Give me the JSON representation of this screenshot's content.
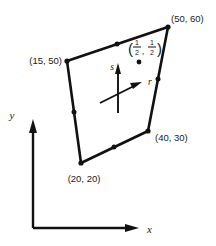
{
  "figure": {
    "background_color": "#ffffff",
    "line_color": "#111111"
  },
  "element": {
    "name": "quadrilateral-element",
    "corner_labels": {
      "top_left": "(15, 50)",
      "top_right": "(50, 60)",
      "bottom_right": "(40, 30)",
      "bottom_left": "(20, 20)"
    },
    "corner_points": [
      {
        "label": "(15, 50)",
        "x": 15,
        "y": 50,
        "px": 67,
        "py": 61
      },
      {
        "label": "(50, 60)",
        "x": 50,
        "y": 60,
        "px": 168,
        "py": 27
      },
      {
        "label": "(40, 30)",
        "x": 40,
        "y": 30,
        "px": 148,
        "py": 131
      },
      {
        "label": "(20, 20)",
        "x": 20,
        "y": 20,
        "px": 81,
        "py": 163
      }
    ],
    "midside_nodes": [
      {
        "name": "top-edge-midnode",
        "px": 117,
        "py": 44
      },
      {
        "name": "right-edge-midnode",
        "px": 158,
        "py": 79
      },
      {
        "name": "bottom-edge-midnode",
        "px": 114,
        "py": 147
      },
      {
        "name": "left-edge-midnode",
        "px": 74,
        "py": 112
      }
    ],
    "interior_point": {
      "name": "half-half-point",
      "label_open_paren": "(",
      "label_close_paren": ")",
      "numerator_r": "1",
      "denominator_r": "2",
      "comma": ",",
      "numerator_s": "1",
      "denominator_s": "2",
      "px": 139,
      "py": 62
    }
  },
  "natural_axes": {
    "origin": {
      "px": 118,
      "py": 95
    },
    "r_label": "r",
    "s_label": "s"
  },
  "global_axes": {
    "x_label": "x",
    "y_label": "y",
    "origin": {
      "px": 33,
      "py": 228
    }
  }
}
